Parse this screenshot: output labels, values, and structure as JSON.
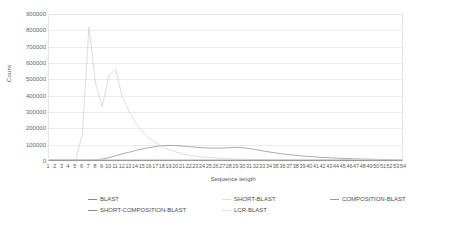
{
  "chart_data": {
    "type": "line",
    "title": "",
    "xlabel": "Sequence length",
    "ylabel": "Count",
    "xlim": [
      1,
      54
    ],
    "ylim": [
      0,
      900000
    ],
    "ytick_step": 100000,
    "grid": true,
    "legend_position": "bottom",
    "yticks": [
      "900000",
      "800000",
      "700000",
      "600000",
      "500000",
      "400000",
      "300000",
      "200000",
      "100000",
      "0"
    ],
    "xticks": [
      "1",
      "2",
      "3",
      "4",
      "5",
      "6",
      "7",
      "8",
      "9",
      "10",
      "11",
      "12",
      "13",
      "14",
      "15",
      "16",
      "17",
      "18",
      "19",
      "20",
      "21",
      "22",
      "23",
      "24",
      "25",
      "26",
      "27",
      "28",
      "29",
      "30",
      "31",
      "32",
      "33",
      "34",
      "35",
      "36",
      "37",
      "38",
      "39",
      "40",
      "41",
      "42",
      "43",
      "44",
      "45",
      "46",
      "47",
      "48",
      "49",
      "50",
      "51",
      "52",
      "53",
      "54"
    ],
    "x": [
      1,
      2,
      3,
      4,
      5,
      6,
      7,
      8,
      9,
      10,
      11,
      12,
      13,
      14,
      15,
      16,
      17,
      18,
      19,
      20,
      21,
      22,
      23,
      24,
      25,
      26,
      27,
      28,
      29,
      30,
      31,
      32,
      33,
      34,
      35,
      36,
      37,
      38,
      39,
      40,
      41,
      42,
      43,
      44,
      45,
      46,
      47,
      48,
      49,
      50,
      51,
      52,
      53,
      54
    ],
    "series": [
      {
        "name": "BLAST",
        "color": "#8a8a8a",
        "values": [
          0,
          0,
          0,
          0,
          0,
          0,
          0,
          2000,
          6000,
          14000,
          26000,
          38000,
          48000,
          58000,
          68000,
          76000,
          83000,
          88000,
          90000,
          89000,
          86000,
          82000,
          79000,
          76000,
          74000,
          73000,
          74000,
          76000,
          78000,
          76000,
          71000,
          64000,
          57000,
          50000,
          44000,
          38000,
          33000,
          29000,
          25000,
          22000,
          19000,
          16000,
          14000,
          12000,
          10000,
          8500,
          7000,
          6000,
          5000,
          4000,
          3200,
          2500,
          1800,
          1000
        ]
      },
      {
        "name": "SHORT-BLAST",
        "color": "#dcdcdc",
        "values": [
          0,
          0,
          0,
          0,
          0,
          0,
          0,
          0,
          0,
          0,
          0,
          0,
          0,
          0,
          0,
          0,
          0,
          0,
          0,
          0,
          0,
          0,
          0,
          0,
          0,
          0,
          0,
          0,
          0,
          0,
          0,
          0,
          0,
          0,
          0,
          0,
          0,
          0,
          0,
          0,
          0,
          0,
          0,
          0,
          0,
          0,
          0,
          0,
          0,
          0,
          0,
          0,
          0,
          0
        ]
      },
      {
        "name": "COMPOSITION-BLAST",
        "color": "#cfcfcf",
        "values": [
          0,
          0,
          0,
          0,
          2000,
          160000,
          820000,
          470000,
          330000,
          520000,
          560000,
          390000,
          300000,
          230000,
          175000,
          135000,
          105000,
          82000,
          64000,
          50000,
          39000,
          30000,
          24000,
          19000,
          15000,
          12000,
          9500,
          7500,
          6000,
          4800,
          3800,
          3000,
          2400,
          1900,
          1500,
          1200,
          950,
          760,
          600,
          480,
          380,
          300,
          240,
          190,
          150,
          120,
          95,
          75,
          60,
          48,
          38,
          30,
          24,
          18
        ]
      },
      {
        "name": "SHORT-COMPOSITION-BLAST",
        "color": "#9e9e9e",
        "values": [
          0,
          0,
          0,
          0,
          0,
          0,
          0,
          0,
          0,
          0,
          0,
          0,
          0,
          0,
          0,
          0,
          0,
          0,
          0,
          0,
          0,
          0,
          0,
          0,
          0,
          0,
          0,
          0,
          0,
          0,
          0,
          0,
          0,
          0,
          0,
          0,
          0,
          0,
          0,
          0,
          0,
          0,
          0,
          0,
          0,
          0,
          0,
          0,
          0,
          0,
          0,
          0,
          0,
          0
        ]
      },
      {
        "name": "LCR-BLAST",
        "color": "#e2e2e2",
        "values": [
          0,
          0,
          0,
          0,
          0,
          0,
          0,
          0,
          0,
          0,
          0,
          0,
          0,
          0,
          0,
          0,
          0,
          0,
          0,
          0,
          0,
          0,
          0,
          0,
          0,
          0,
          0,
          0,
          0,
          0,
          0,
          0,
          0,
          0,
          0,
          0,
          0,
          0,
          0,
          0,
          0,
          0,
          0,
          0,
          0,
          0,
          0,
          0,
          0,
          0,
          0,
          0,
          0,
          0
        ]
      }
    ],
    "annotations": []
  },
  "axes": {
    "y_title": "Count",
    "x_title": "Sequence length"
  },
  "legend": {
    "items": [
      {
        "label": "BLAST",
        "color": "#8a8a8a"
      },
      {
        "label": "SHORT-BLAST",
        "color": "#dedede"
      },
      {
        "label": "COMPOSITION-BLAST",
        "color": "#9a9a9a"
      },
      {
        "label": "SHORT-COMPOSITION-BLAST",
        "color": "#8a8a8a"
      },
      {
        "label": "LCR-BLAST",
        "color": "#e0e0e0"
      }
    ]
  },
  "colors": {
    "gridline": "#ececec",
    "axis": "#9a9a9a",
    "text": "#555555"
  }
}
